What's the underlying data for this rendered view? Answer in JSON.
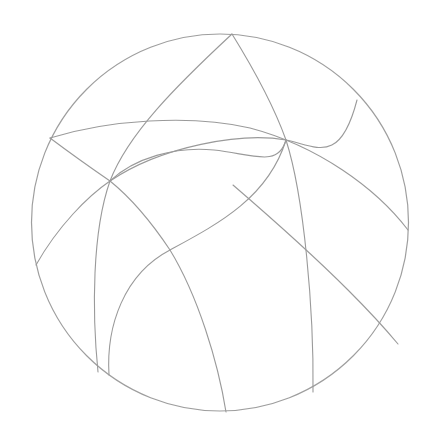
{
  "document": {
    "title": "Spherical Arc Net",
    "type": "geometric-line-drawing",
    "background_color": "#ffffff",
    "width": 436,
    "height": 445
  },
  "style": {
    "stroke_color": "#9a9a9a",
    "stroke_color_outline": "#9e9e9e",
    "stroke_width": 1.1,
    "outline_stroke_width": 1.2,
    "fill": "none"
  },
  "figure": {
    "name": "sphere-wireframe",
    "outline": {
      "name": "sphere-outline-circle",
      "shape": "circle",
      "cx": 220,
      "cy": 222.5,
      "r": 188.5
    },
    "vertices": [
      {
        "id": "v-top",
        "label": "top pole vertex",
        "x": 232,
        "y": 34
      },
      {
        "id": "v-left-upper",
        "label": "upper left rim vertex",
        "x": 50,
        "y": 138
      },
      {
        "id": "v-right-upper",
        "label": "upper right rim vertex",
        "x": 357,
        "y": 100
      },
      {
        "id": "v-right-mid",
        "label": "right rim vertex",
        "x": 408,
        "y": 230
      },
      {
        "id": "v-left-mid",
        "label": "left rim vertex",
        "x": 36,
        "y": 265
      },
      {
        "id": "v-bottom-left-a",
        "label": "lower left rim vertex A",
        "x": 98,
        "y": 372
      },
      {
        "id": "v-bottom-left-b",
        "label": "lower left rim vertex B",
        "x": 109,
        "y": 375
      },
      {
        "id": "v-bottom-mid",
        "label": "bottom rim vertex",
        "x": 226,
        "y": 412
      },
      {
        "id": "v-bottom-right",
        "label": "lower right rim vertex",
        "x": 313,
        "y": 392
      },
      {
        "id": "x-left",
        "label": "left interior crossing",
        "x": 110,
        "y": 181
      },
      {
        "id": "x-center",
        "label": "center interior crossing",
        "x": 170,
        "y": 250
      },
      {
        "id": "x-mid",
        "label": "mid interior crossing",
        "x": 233,
        "y": 185
      },
      {
        "id": "x-right",
        "label": "right interior crossing",
        "x": 286,
        "y": 140
      }
    ],
    "arcs": [
      {
        "id": "arc-1",
        "name": "meridian-top-to-lower-left",
        "from": "v-top",
        "to": "v-bottom-left-a",
        "d": "M 232 34 C 176 86, 128 134, 110 181 C 92 232, 92 312, 98 372"
      },
      {
        "id": "arc-2",
        "name": "meridian-top-to-lower-right",
        "from": "v-top",
        "to": "v-bottom-right",
        "d": "M 232 34 C 258 76, 276 112, 286 140 C 304 196, 314 310, 313 392"
      },
      {
        "id": "arc-3",
        "name": "upper-latitude-left-rim-to-right-rim",
        "from": "v-left-upper",
        "to": "v-right-mid",
        "d": "M 50 138 C 108 120, 190 114, 250 128 C 318 146, 376 188, 408 230"
      },
      {
        "id": "arc-4",
        "name": "diagonal-left-rim-to-bottom",
        "from": "v-left-upper",
        "to": "v-bottom-mid",
        "d": "M 50 138 C 74 156, 94 170, 110 181 C 136 202, 158 232, 170 250 C 198 296, 218 362, 226 412"
      },
      {
        "id": "arc-5",
        "name": "diagonal-left-rim-to-upper-right-rim",
        "from": "v-left-mid",
        "to": "v-right-upper",
        "d": "M 36 265 C 58 226, 88 196, 110 181 C 162 146, 242 132, 286 140 C 316 146, 340 166, 357 100"
      },
      {
        "id": "arc-6",
        "name": "lower-latitude-arc-left-to-right",
        "from": "v-bottom-left-b",
        "to": "v-right-upper-join",
        "d": "M 109 375 C 106 326, 124 274, 170 250 C 218 224, 268 198, 286 140"
      },
      {
        "id": "arc-7",
        "name": "interior-latitude-crest",
        "from": "x-left",
        "to": "x-right",
        "d": "M 110 181 C 134 158, 176 146, 214 150 C 252 154, 278 168, 286 140"
      },
      {
        "id": "arc-8",
        "name": "mid-diagonal-to-lower-right-rim",
        "from": "x-mid",
        "to": "v-right-lower-rim",
        "d": "M 233 185 C 262 210, 310 252, 348 290 C 372 314, 388 332, 398 344"
      }
    ]
  }
}
